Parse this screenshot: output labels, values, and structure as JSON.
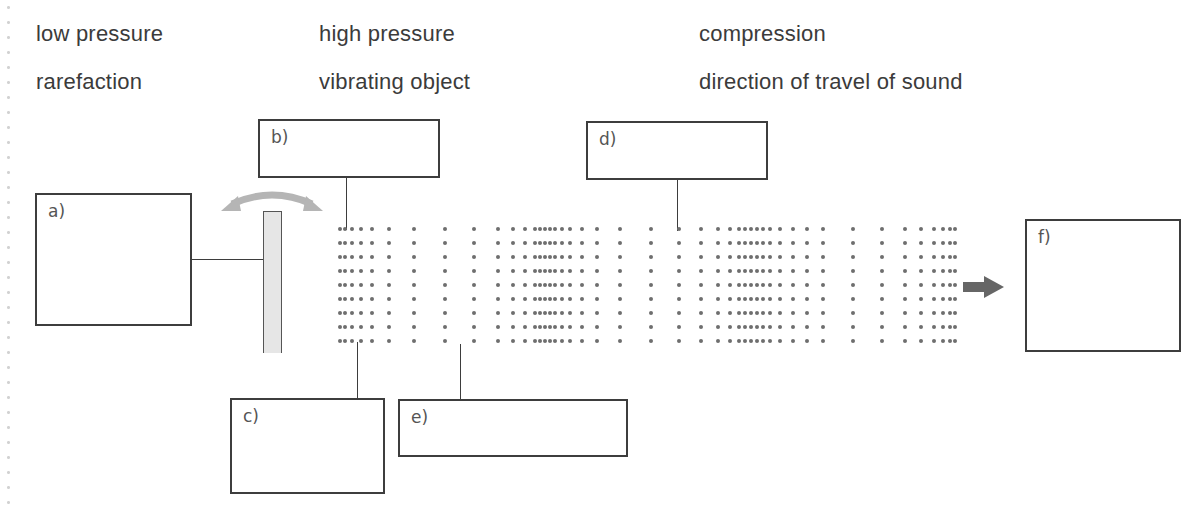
{
  "word_bank": {
    "row1": [
      "low pressure",
      "high pressure",
      "compression"
    ],
    "row2": [
      "rarefaction",
      "vibrating object",
      "direction of travel of sound"
    ]
  },
  "label_boxes": {
    "a": "a)",
    "b": "b)",
    "c": "c)",
    "d": "d)",
    "e": "e)",
    "f": "f)"
  },
  "diagram": {
    "icons": {
      "vibration": "curved-double-arrow-icon",
      "direction": "right-arrow-icon",
      "source": "vibrating-rod"
    },
    "dot_rows_y": [
      229,
      243,
      257,
      271,
      285,
      299,
      313,
      327,
      341
    ],
    "dot_columns_x": [
      340,
      345,
      352,
      361,
      372,
      389,
      414,
      445,
      474,
      498,
      513,
      525,
      535,
      540,
      545,
      550,
      555,
      562,
      570,
      582,
      597,
      620,
      651,
      679,
      701,
      718,
      730,
      739,
      745,
      751,
      757,
      763,
      770,
      780,
      793,
      807,
      823,
      853,
      882,
      905,
      921,
      934,
      943,
      950,
      955
    ],
    "colors": {
      "text": "#3b3b3b",
      "border": "#3d3d3d",
      "dots": "#6e6e6e",
      "arrow": "#666666",
      "vibration_arrow": "#b5b5b5",
      "rod_fill": "#e6e6e6"
    }
  }
}
